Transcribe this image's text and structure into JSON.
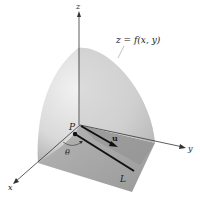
{
  "figure": {
    "axes": {
      "x": "x",
      "y": "y",
      "z": "z"
    },
    "surface_label": "z = f(x, y)",
    "point_label": "P",
    "vector_label": "u",
    "angle_label": "θ",
    "line_label": "L"
  },
  "colors": {
    "surface_light": "#eeeeee",
    "surface_dark": "#b8b8b8",
    "floor": "#a9a9a9",
    "floor_shadow": "#8e8e8e",
    "axis": "#333333",
    "line": "#111111"
  }
}
